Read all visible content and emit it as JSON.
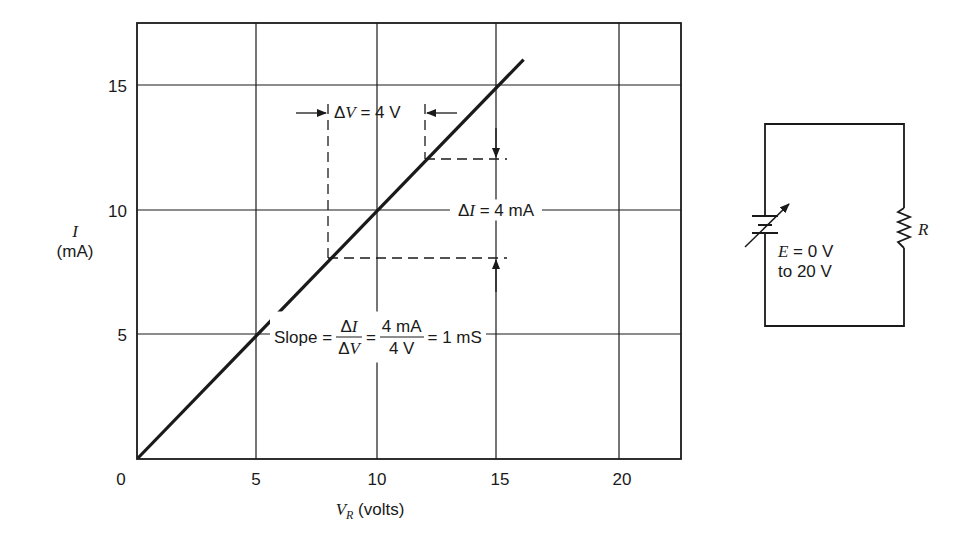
{
  "chart_data": {
    "type": "line",
    "title": "",
    "xlabel": "V_R (volts)",
    "ylabel": "I (mA)",
    "xlim": [
      0,
      22.5
    ],
    "ylim": [
      0,
      17.5
    ],
    "x_ticks": [
      0,
      5,
      10,
      15,
      20
    ],
    "y_ticks": [
      5,
      10,
      15
    ],
    "grid": true,
    "series": [
      {
        "name": "I vs V_R",
        "x": [
          0,
          5,
          8,
          10,
          12,
          15,
          16
        ],
        "y": [
          0,
          5,
          8,
          10,
          12,
          15,
          16
        ]
      }
    ],
    "annotations": [
      {
        "text": "ΔV = 4 V",
        "from_x": 8,
        "to_x": 12
      },
      {
        "text": "ΔI = 4 mA",
        "from_y": 8,
        "to_y": 12
      },
      {
        "text": "Slope = ΔI/ΔV = 4 mA/4 V = 1 mS"
      }
    ]
  },
  "axes": {
    "x_tick_labels": [
      "0",
      "5",
      "10",
      "15",
      "20"
    ],
    "y_tick_labels": [
      "5",
      "10",
      "15"
    ],
    "x_label_var": "V",
    "x_label_sub": "R",
    "x_label_unit": "(volts)",
    "y_label_var": "I",
    "y_label_unit": "(mA)"
  },
  "annotations": {
    "delta_v": {
      "sym": "Δ",
      "var": "V",
      "rest": " = 4 V"
    },
    "delta_i": {
      "sym": "Δ",
      "var": "I",
      "rest": " = 4 mA"
    },
    "slope": {
      "prefix": "Slope =",
      "frac1_num_sym": "Δ",
      "frac1_num_var": "I",
      "frac1_den_sym": "Δ",
      "frac1_den_var": "V",
      "eq1": "=",
      "frac2_num": "4 mA",
      "frac2_den": "4 V",
      "result": "= 1 mS"
    }
  },
  "circuit": {
    "source_var": "E",
    "source_line1_rest": " = 0 V",
    "source_line2": "to 20 V",
    "resistor_label": "R"
  },
  "colors": {
    "ink": "#1a1a1a",
    "background": "#ffffff"
  }
}
